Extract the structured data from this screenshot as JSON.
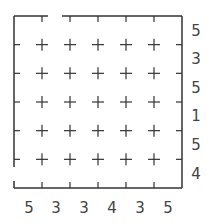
{
  "puzzle": {
    "rows": 6,
    "cols": 6,
    "line_color": "#333333",
    "clue_color": "#444444",
    "entrance": {
      "side": "top",
      "col": 1
    },
    "exit": {
      "side": "left",
      "row": 5
    },
    "right_clues": [
      "5",
      "3",
      "5",
      "1",
      "5",
      "4"
    ],
    "bottom_clues": [
      "5",
      "3",
      "3",
      "4",
      "3",
      "5"
    ]
  }
}
